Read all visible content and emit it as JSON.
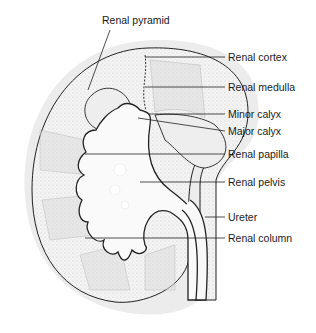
{
  "diagram": {
    "labels": [
      {
        "id": "renal-pyramid",
        "text": "Renal pyramid"
      },
      {
        "id": "renal-cortex",
        "text": "Renal cortex"
      },
      {
        "id": "renal-medulla",
        "text": "Renal medulla"
      },
      {
        "id": "minor-calyx",
        "text": "Minor calyx"
      },
      {
        "id": "major-calyx",
        "text": "Major calyx"
      },
      {
        "id": "renal-papilla",
        "text": "Renal papilla"
      },
      {
        "id": "renal-pelvis",
        "text": "Renal pelvis"
      },
      {
        "id": "ureter",
        "text": "Ureter"
      },
      {
        "id": "renal-column",
        "text": "Renal column"
      }
    ]
  }
}
